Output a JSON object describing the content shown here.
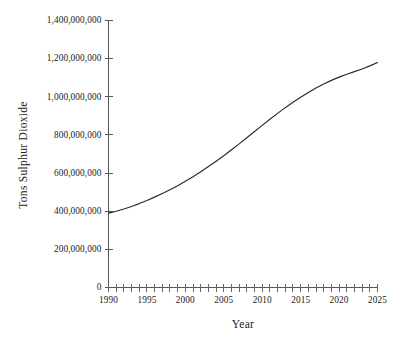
{
  "chart_data": {
    "type": "line",
    "title": "",
    "subtitle": "",
    "xlabel": "Year",
    "ylabel": "Tons Sulphur Dioxide",
    "xlim": [
      1990,
      2025
    ],
    "ylim": [
      0,
      1400000000
    ],
    "grid": false,
    "legend_position": "none",
    "y_tick_labels": [
      "1,400,000,000",
      "1,200,000,000",
      "1,000,000,000",
      "800,000,000",
      "600,000,000",
      "400,000,000",
      "200,000,000",
      "0"
    ],
    "y_tick_values": [
      1400000000,
      1200000000,
      1000000000,
      800000000,
      600000000,
      400000000,
      200000000,
      0
    ],
    "x_tick_labels": [
      "1990",
      "1995",
      "2000",
      "2005",
      "2010",
      "2015",
      "2020",
      "2025"
    ],
    "x_tick_values": [
      1990,
      1995,
      2000,
      2005,
      2010,
      2015,
      2020,
      2025
    ],
    "x_minor_tick_interval": 1,
    "line_color": "#2a2a2a",
    "axis_color": "#555555",
    "background_color": "#ffffff",
    "series": [
      {
        "name": "Tons Sulphur Dioxide",
        "x": [
          1990,
          1991,
          1992,
          1993,
          1994,
          1995,
          1996,
          1997,
          1998,
          1999,
          2000,
          2001,
          2002,
          2003,
          2004,
          2005,
          2006,
          2007,
          2008,
          2009,
          2010,
          2011,
          2012,
          2013,
          2014,
          2015,
          2016,
          2017,
          2018,
          2019,
          2020,
          2021,
          2022,
          2023,
          2024,
          2025
        ],
        "values": [
          390000000,
          400000000,
          412000000,
          425000000,
          440000000,
          456000000,
          474000000,
          493000000,
          513000000,
          534000000,
          557000000,
          581000000,
          607000000,
          634000000,
          662000000,
          691000000,
          722000000,
          753000000,
          785000000,
          818000000,
          850000000,
          882000000,
          913000000,
          943000000,
          971000000,
          998000000,
          1023000000,
          1046000000,
          1067000000,
          1086000000,
          1103000000,
          1118000000,
          1132000000,
          1146000000,
          1162000000,
          1180000000
        ]
      }
    ]
  }
}
